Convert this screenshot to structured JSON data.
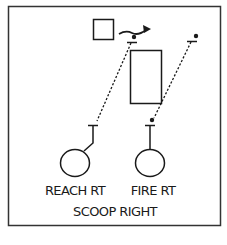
{
  "diagram": {
    "type": "football-play",
    "title": "SCOOP RIGHT",
    "players": [
      {
        "label": "REACH RT",
        "role": "lineman-left"
      },
      {
        "label": "FIRE RT",
        "role": "lineman-right"
      }
    ],
    "colors": {
      "ink": "#1a1a1a",
      "background": "#ffffff"
    }
  }
}
